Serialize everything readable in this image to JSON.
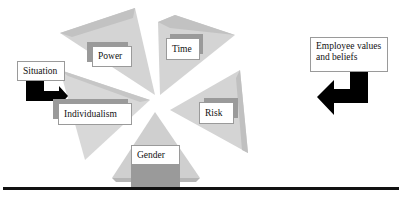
{
  "diagram": {
    "title": "",
    "center_dimensions": [
      {
        "id": "power",
        "label": "Power"
      },
      {
        "id": "time",
        "label": "Time"
      },
      {
        "id": "individualism",
        "label": "Individualism"
      },
      {
        "id": "risk",
        "label": "Risk"
      },
      {
        "id": "gender",
        "label": "Gender"
      }
    ],
    "left_influence": {
      "label": "Situation"
    },
    "right_influence": {
      "label": "Employee values and beliefs"
    },
    "colors": {
      "wedge_fill": "#d6d6d6",
      "wedge_shade": "#bdbdbd",
      "tab_fill": "#9a9a9a",
      "arrow_fill": "#000000",
      "baseline": "#111111"
    }
  }
}
